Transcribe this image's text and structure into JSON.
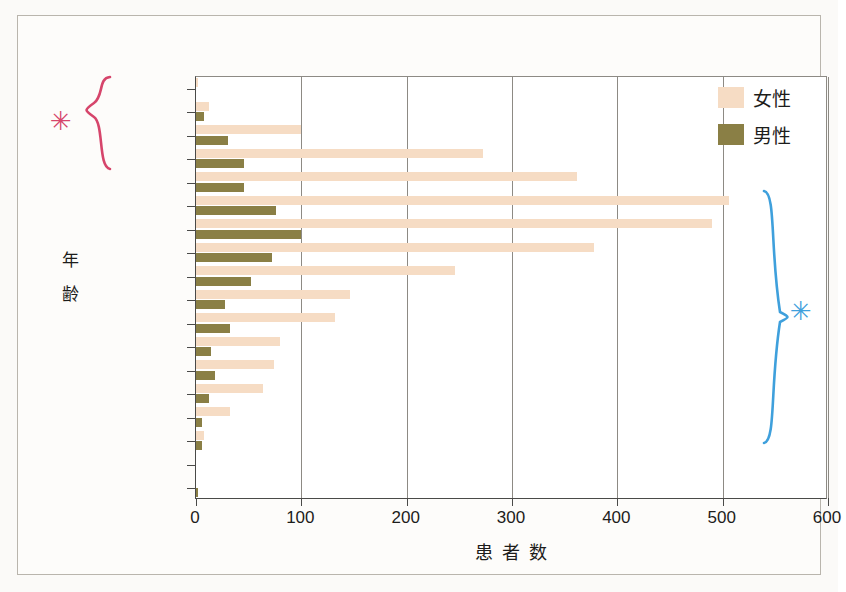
{
  "chart_data": {
    "type": "bar",
    "orientation": "horizontal",
    "title": "",
    "xlabel": "患者数",
    "ylabel": "年齢",
    "xlim": [
      0,
      600
    ],
    "xticks": [
      "0",
      "100",
      "200",
      "300",
      "400",
      "500",
      "600"
    ],
    "grid": "vertical",
    "legend_position": "top-right",
    "categories": [
      "0 ～ 4",
      "5 ～ 9",
      "10～14",
      "15～19",
      "20～24",
      "25～29",
      "30～34",
      "35～39",
      "40～44",
      "45～49",
      "50～54",
      "55～59",
      "60～64",
      "65～69",
      "70～74",
      "75～79",
      "80～84",
      "85～89"
    ],
    "series": [
      {
        "name": "女性",
        "color": "#f6dcc4",
        "values": [
          2,
          12,
          100,
          272,
          362,
          506,
          490,
          378,
          246,
          146,
          132,
          80,
          74,
          64,
          32,
          8,
          0,
          0
        ]
      },
      {
        "name": "男性",
        "color": "#8a7f45",
        "values": [
          0,
          8,
          30,
          46,
          46,
          76,
          100,
          72,
          52,
          28,
          32,
          14,
          18,
          12,
          6,
          6,
          0,
          2
        ]
      }
    ],
    "annotations": [
      {
        "name": "red-brace",
        "symbol": "*",
        "color": "#d6456b",
        "spans_categories": [
          "0 ～ 4",
          "15～19"
        ],
        "side": "left"
      },
      {
        "name": "blue-brace",
        "symbol": "*",
        "color": "#3fa0dc",
        "spans_categories": [
          "25～29",
          "75～79"
        ],
        "side": "right"
      }
    ]
  },
  "legend": {
    "entries": [
      {
        "label": "女性",
        "color": "#f6dcc4"
      },
      {
        "label": "男性",
        "color": "#8a7f45"
      }
    ]
  },
  "axis": {
    "y_title_chars": [
      "年",
      "齢"
    ],
    "x_title": "患者数"
  }
}
